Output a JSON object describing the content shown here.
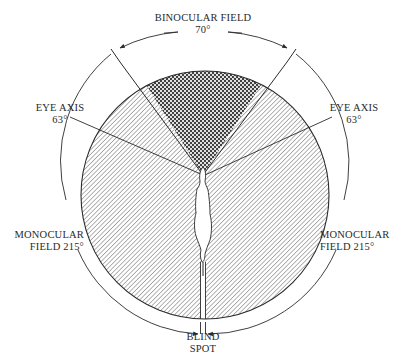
{
  "diagram": {
    "colors": {
      "ink": "#2a2a2a",
      "hatch": "#555555",
      "crosshatch": "#4a4a4a",
      "background": "#ffffff"
    },
    "labels": {
      "binocular_title": "BINOCULAR FIELD",
      "binocular_angle": "70°",
      "eye_axis_left_title": "EYE AXIS",
      "eye_axis_left_angle": "63°",
      "eye_axis_right_title": "EYE AXIS",
      "eye_axis_right_angle": "63°",
      "monocular_left_line1": "MONOCULAR",
      "monocular_left_line2": "FIELD 215°",
      "monocular_right_line1": "MONOCULAR",
      "monocular_right_line2": "FIELD  215°",
      "blind_spot_line1": "BLIND",
      "blind_spot_line2": "SPOT"
    },
    "regions": [
      {
        "name": "binocular-field",
        "angle_deg": 70,
        "fill": "crosshatch"
      },
      {
        "name": "monocular-field-left",
        "angle_deg": 215,
        "fill": "diagonal-hatch"
      },
      {
        "name": "monocular-field-right",
        "angle_deg": 215,
        "fill": "diagonal-hatch"
      },
      {
        "name": "blind-spot",
        "fill": "none"
      }
    ],
    "eye_axis_angle_deg": 63
  }
}
